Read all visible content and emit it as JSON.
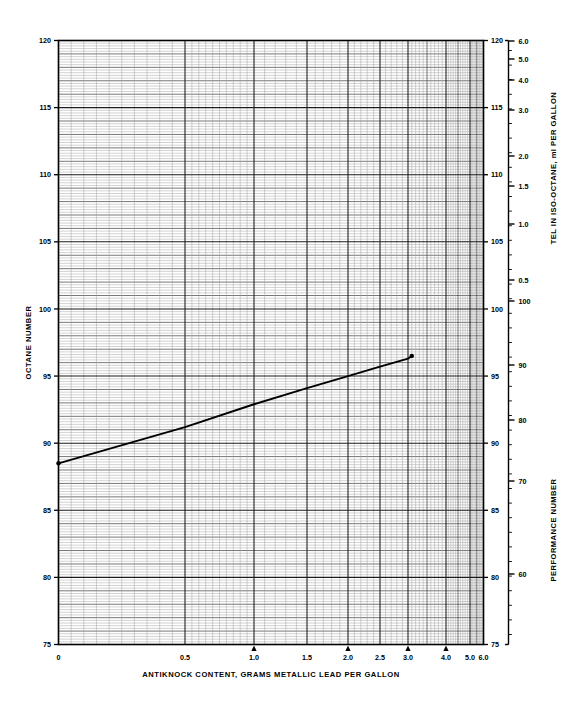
{
  "figure": {
    "background": "#ffffff",
    "ink": "#000000",
    "grid_minor_color": "#8a8a8a",
    "grid_major_color": "#2b2b2b",
    "frame_color": "#000000",
    "line_color": "#000000"
  },
  "left_axis": {
    "title": "OCTANE NUMBER",
    "ticks": [
      120,
      115,
      110,
      105,
      100,
      95,
      90,
      85,
      80,
      75
    ],
    "min": 75,
    "max": 120
  },
  "right_axis_octane": {
    "ticks": [
      120,
      115,
      110,
      105,
      100,
      95,
      90,
      85,
      80,
      75
    ]
  },
  "bottom_axis": {
    "title": "ANTIKNOCK CONTENT, GRAMS METALLIC LEAD PER GALLON",
    "ticks": [
      {
        "label": "0",
        "value": 0.0,
        "marker": false
      },
      {
        "label": "0.5",
        "value": 0.5,
        "marker": false
      },
      {
        "label": "1.0",
        "value": 1.0,
        "marker": true
      },
      {
        "label": "1.5",
        "value": 1.5,
        "marker": false
      },
      {
        "label": "2.0",
        "value": 2.0,
        "marker": true
      },
      {
        "label": "2.5",
        "value": 2.5,
        "marker": false
      },
      {
        "label": "3.0",
        "value": 3.0,
        "marker": true
      },
      {
        "label": "4.0",
        "value": 4.0,
        "marker": true
      },
      {
        "label": "5.0",
        "value": 5.0,
        "marker": false
      },
      {
        "label": "6.0",
        "value": 6.0,
        "marker": false
      }
    ],
    "min": 0.0,
    "max": 6.0
  },
  "tel_axis": {
    "title": "TEL IN ISO-OCTANE, ml PER GALLON",
    "ticks": [
      {
        "label": "6.0",
        "y": 41
      },
      {
        "label": "5.0",
        "y": 59
      },
      {
        "label": "4.0",
        "y": 80
      },
      {
        "label": "3.0",
        "y": 110
      },
      {
        "label": "2.0",
        "y": 156
      },
      {
        "label": "1.5",
        "y": 186
      },
      {
        "label": "1.0",
        "y": 224
      },
      {
        "label": "0.5",
        "y": 280
      }
    ]
  },
  "performance_axis": {
    "title": "PERFORMANCE NUMBER",
    "ticks": [
      {
        "label": "100",
        "y": 301
      },
      {
        "label": "90",
        "y": 365
      },
      {
        "label": "80",
        "y": 420
      },
      {
        "label": "70",
        "y": 481
      },
      {
        "label": "60",
        "y": 574
      }
    ]
  },
  "chart_data": {
    "type": "line",
    "title": "",
    "subtitle": "",
    "xlabel": "ANTIKNOCK CONTENT, GRAMS METALLIC LEAD PER GALLON",
    "ylabel": "OCTANE NUMBER",
    "y2label": "PERFORMANCE NUMBER",
    "y3label": "TEL IN ISO-OCTANE, ml PER GALLON",
    "grid": true,
    "legend": "none",
    "xlim": [
      0.0,
      6.0
    ],
    "ylim": [
      75,
      120
    ],
    "x_scale": "compressed-log (TEL response)",
    "xticks": [
      0.0,
      0.5,
      1.0,
      1.5,
      2.0,
      2.5,
      3.0,
      4.0,
      5.0,
      6.0
    ],
    "yticks": [
      75,
      80,
      85,
      90,
      95,
      100,
      105,
      110,
      115,
      120
    ],
    "series": [
      {
        "name": "Antiknock response",
        "marker": "dot-endpoints",
        "x": [
          0.0,
          0.5,
          1.0,
          1.5,
          2.0,
          2.5,
          3.0,
          3.1
        ],
        "y": [
          88.5,
          91.2,
          92.9,
          94.1,
          95.0,
          95.7,
          96.3,
          96.5
        ]
      }
    ],
    "annotations": [
      {
        "text": "triangle tick marker",
        "x": 1.0
      },
      {
        "text": "triangle tick marker",
        "x": 2.0
      },
      {
        "text": "triangle tick marker",
        "x": 3.0
      },
      {
        "text": "triangle tick marker",
        "x": 4.0
      }
    ]
  }
}
